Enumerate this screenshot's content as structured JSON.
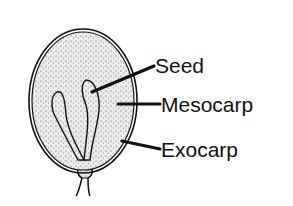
{
  "diagram": {
    "labels": [
      {
        "id": "seed",
        "text": "Seed"
      },
      {
        "id": "mesocarp",
        "text": "Mesocarp"
      },
      {
        "id": "exocarp",
        "text": "Exocarp"
      }
    ]
  },
  "colors": {
    "ink": "#111111",
    "flesh": "#e6e6e6",
    "background": "#ffffff"
  }
}
